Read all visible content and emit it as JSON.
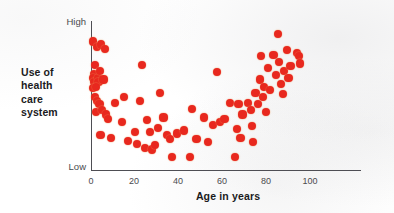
{
  "chart_data": {
    "type": "scatter",
    "title": "",
    "xlabel": "Age in years",
    "ylabel": "Use of health care system",
    "ylabel_lines": [
      "Use of",
      "health",
      "care",
      "system"
    ],
    "xlim": [
      0,
      100
    ],
    "ylim": [
      0,
      100
    ],
    "xticks": [
      0,
      20,
      40,
      60,
      80,
      100
    ],
    "xticklabels": [
      "0",
      "20",
      "40",
      "60",
      "80",
      "100"
    ],
    "yticklabels": [
      "Low",
      "High"
    ],
    "y_low_label": "Low",
    "y_high_label": "High",
    "grid": false,
    "legend": null,
    "marker_color": "#E8281E",
    "axis_color": "#4E4E54",
    "series": [
      {
        "name": "Health care utilization by age",
        "points": [
          [
            0.5,
            88
          ],
          [
            1.0,
            66
          ],
          [
            0.6,
            63
          ],
          [
            0.8,
            60
          ],
          [
            0.4,
            56
          ],
          [
            1.2,
            72
          ],
          [
            2.0,
            84
          ],
          [
            2.4,
            63
          ],
          [
            2.6,
            60
          ],
          [
            1.8,
            57
          ],
          [
            3.2,
            68
          ],
          [
            3.6,
            86
          ],
          [
            4.6,
            62
          ],
          [
            5.0,
            83
          ],
          [
            1.4,
            50
          ],
          [
            2.2,
            47
          ],
          [
            3.0,
            45
          ],
          [
            1.6,
            40
          ],
          [
            4.0,
            41
          ],
          [
            5.4,
            38
          ],
          [
            3.4,
            24
          ],
          [
            6.2,
            35
          ],
          [
            7.4,
            22
          ],
          [
            9.0,
            46
          ],
          [
            11.8,
            33
          ],
          [
            12.6,
            50
          ],
          [
            14.2,
            20
          ],
          [
            16.8,
            26
          ],
          [
            17.6,
            18
          ],
          [
            18.6,
            47
          ],
          [
            19.4,
            72
          ],
          [
            20.6,
            15
          ],
          [
            21.4,
            34
          ],
          [
            22.6,
            26
          ],
          [
            23.2,
            14
          ],
          [
            24.4,
            17
          ],
          [
            25.6,
            29
          ],
          [
            26.4,
            53
          ],
          [
            27.8,
            36
          ],
          [
            29.0,
            24
          ],
          [
            30.4,
            21
          ],
          [
            31.2,
            9
          ],
          [
            33.0,
            25
          ],
          [
            35.6,
            27
          ],
          [
            38.2,
            9
          ],
          [
            38.8,
            42
          ],
          [
            40.6,
            21
          ],
          [
            43.6,
            36
          ],
          [
            45.0,
            19
          ],
          [
            47.0,
            31
          ],
          [
            48.6,
            67
          ],
          [
            49.8,
            33
          ],
          [
            51.4,
            35
          ],
          [
            53.6,
            46
          ],
          [
            55.4,
            9
          ],
          [
            56.2,
            28
          ],
          [
            56.8,
            45
          ],
          [
            57.6,
            22
          ],
          [
            58.4,
            38
          ],
          [
            60.6,
            46
          ],
          [
            61.6,
            41
          ],
          [
            62.0,
            30
          ],
          [
            62.6,
            19
          ],
          [
            63.4,
            53
          ],
          [
            64.4,
            45
          ],
          [
            65.0,
            62
          ],
          [
            65.6,
            78
          ],
          [
            66.2,
            50
          ],
          [
            66.8,
            57
          ],
          [
            67.4,
            40
          ],
          [
            68.2,
            70
          ],
          [
            69.0,
            55
          ],
          [
            70.4,
            79
          ],
          [
            71.2,
            65
          ],
          [
            72.0,
            93
          ],
          [
            72.6,
            74
          ],
          [
            73.2,
            59
          ],
          [
            74.0,
            52
          ],
          [
            74.6,
            68
          ],
          [
            75.6,
            82
          ],
          [
            76.2,
            63
          ],
          [
            77.0,
            71
          ],
          [
            79.4,
            80
          ],
          [
            80.2,
            78
          ],
          [
            80.6,
            73
          ]
        ]
      }
    ]
  }
}
